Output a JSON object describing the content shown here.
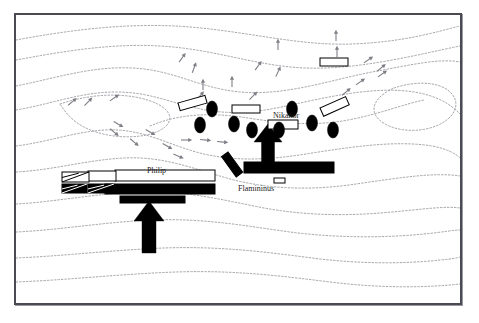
{
  "figure": {
    "kind": "battle-map",
    "title_visible": false,
    "frame": {
      "x": 14,
      "y": 13,
      "width": 448,
      "height": 292,
      "border_color": "#4a4a52",
      "background": "#ffffff"
    }
  },
  "palette": {
    "ink": "#000000",
    "contour": "#8d8d95",
    "frame": "#4a4a52",
    "paper": "#ffffff",
    "hachure": "#7e7e86"
  },
  "labels": [
    {
      "name": "label-nikanor",
      "text": "Nikanor",
      "x": 273,
      "y": 112,
      "size": 8.0
    },
    {
      "name": "label-philip",
      "text": "Philip",
      "x": 147,
      "y": 167,
      "size": 8.0
    },
    {
      "name": "label-flamininus",
      "text": "Flamininus",
      "x": 238,
      "y": 185,
      "size": 8.0
    }
  ],
  "contours": [
    "M16,40 C70,30 130,22 190,27 C250,32 300,46 352,44 C404,42 436,32 460,26",
    "M16,60 C60,52 110,43 160,46 C215,49 255,66 305,68 C360,70 420,54 460,46",
    "M16,86 C56,78 92,66 132,68 C175,70 198,88 240,92 C286,96 330,80 372,72 C410,65 440,58 460,62",
    "M16,110 C52,104 80,92 116,92 C152,92 172,104 206,110 C246,117 276,108 314,100 C352,92 392,86 424,94 C444,99 454,108 460,114",
    "M60,104 C84,96 112,92 140,98 C166,104 176,116 166,126 C154,138 120,140 96,132 C74,125 66,113 60,104",
    "M150,126 C178,114 210,112 248,118 C286,124 316,126 348,120 C380,114 404,104 424,100",
    "M394,88 C418,80 442,82 452,94 C462,106 452,122 430,128 C408,134 384,128 376,116 C370,106 378,95 394,88",
    "M16,146 C48,142 74,132 104,130 C140,128 162,142 196,152 C232,162 268,160 306,154 C350,147 396,140 432,146 C448,149 456,154 460,158",
    "M16,172 C54,170 86,160 124,158 C166,156 196,170 234,180 C274,190 316,190 356,184 C398,178 434,172 460,176",
    "M16,204 C54,202 92,194 136,192 C186,190 222,200 264,208 C308,216 350,216 392,212 C424,209 446,206 460,208",
    "M16,232 C60,230 104,222 152,220 C204,218 246,226 290,232 C336,238 384,238 424,234 C444,232 454,230 460,230",
    "M16,258 C64,256 112,250 164,248 C220,246 266,252 312,258 C358,264 404,264 440,260 C452,259 457,258 460,257",
    "M16,282 C68,280 120,274 176,272 C234,270 282,276 330,282 C378,288 424,288 460,284"
  ],
  "hachures": [
    {
      "x": 336,
      "y": 36,
      "angle": 0
    },
    {
      "x": 337,
      "y": 52,
      "angle": 0
    },
    {
      "x": 278,
      "y": 45,
      "angle": 0
    },
    {
      "x": 182,
      "y": 58,
      "angle": 35
    },
    {
      "x": 194,
      "y": 68,
      "angle": 20
    },
    {
      "x": 258,
      "y": 66,
      "angle": 35
    },
    {
      "x": 278,
      "y": 72,
      "angle": 25
    },
    {
      "x": 203,
      "y": 85,
      "angle": 0
    },
    {
      "x": 232,
      "y": 82,
      "angle": 0
    },
    {
      "x": 200,
      "y": 96,
      "angle": 40
    },
    {
      "x": 253,
      "y": 96,
      "angle": 45
    },
    {
      "x": 368,
      "y": 60,
      "angle": 55
    },
    {
      "x": 382,
      "y": 74,
      "angle": 55
    },
    {
      "x": 360,
      "y": 82,
      "angle": 55
    },
    {
      "x": 346,
      "y": 92,
      "angle": 50
    },
    {
      "x": 381,
      "y": 68,
      "angle": 50
    },
    {
      "x": 72,
      "y": 102,
      "angle": 50
    },
    {
      "x": 88,
      "y": 102,
      "angle": 45
    },
    {
      "x": 114,
      "y": 98,
      "angle": 55
    },
    {
      "x": 118,
      "y": 124,
      "angle": 120
    },
    {
      "x": 114,
      "y": 132,
      "angle": 130
    },
    {
      "x": 134,
      "y": 142,
      "angle": 130
    },
    {
      "x": 150,
      "y": 132,
      "angle": 120
    },
    {
      "x": 167,
      "y": 146,
      "angle": 120
    },
    {
      "x": 186,
      "y": 140,
      "angle": 90
    },
    {
      "x": 205,
      "y": 140,
      "angle": 95
    },
    {
      "x": 222,
      "y": 142,
      "angle": 95
    },
    {
      "x": 178,
      "y": 156,
      "angle": 115
    }
  ],
  "units": [
    {
      "name": "unit-macedonian-phalanx-right",
      "side": "macedonian",
      "shape": "rect-white",
      "x": 178,
      "y": 103,
      "w": 28,
      "h": 8,
      "rotate": -16
    },
    {
      "name": "unit-macedonian-phalanx-center",
      "side": "macedonian",
      "shape": "rect-white",
      "x": 232,
      "y": 105,
      "w": 28,
      "h": 8,
      "rotate": 0
    },
    {
      "name": "unit-macedonian-phalanx-nikanor",
      "side": "macedonian",
      "shape": "rect-white",
      "x": 268,
      "y": 120,
      "w": 30,
      "h": 9,
      "rotate": 0
    },
    {
      "name": "unit-macedonian-phalanx-far-right",
      "side": "macedonian",
      "shape": "rect-white",
      "x": 320,
      "y": 108,
      "w": 28,
      "h": 9,
      "rotate": -24
    },
    {
      "name": "unit-macedonian-reserve-top",
      "side": "macedonian",
      "shape": "rect-white",
      "x": 320,
      "y": 58,
      "w": 28,
      "h": 8,
      "rotate": 0
    },
    {
      "name": "unit-macedonian-light-diagonal",
      "side": "macedonian",
      "shape": "rect-black",
      "x": 228,
      "y": 152,
      "w": 25,
      "h": 8,
      "rotate": 54
    },
    {
      "name": "unit-macedonian-left-line",
      "side": "macedonian",
      "shape": "rect-white",
      "x": 115,
      "y": 170,
      "w": 100,
      "h": 11,
      "rotate": 0
    },
    {
      "name": "unit-macedonian-left-second",
      "side": "macedonian",
      "shape": "rect-white",
      "x": 88,
      "y": 171,
      "w": 28,
      "h": 10,
      "rotate": 0
    },
    {
      "name": "unit-macedonian-cavalry-left",
      "side": "macedonian",
      "shape": "rect-white-cav",
      "x": 62,
      "y": 172,
      "w": 27,
      "h": 10,
      "rotate": 0
    },
    {
      "name": "unit-roman-legion-right",
      "side": "roman",
      "shape": "rect-black",
      "x": 244,
      "y": 162,
      "w": 90,
      "h": 11,
      "rotate": 0
    },
    {
      "name": "unit-roman-small-marker",
      "side": "roman",
      "shape": "rect-white",
      "x": 274,
      "y": 178,
      "w": 11,
      "h": 5,
      "rotate": 0
    },
    {
      "name": "unit-roman-legion-left",
      "side": "roman",
      "shape": "rect-black",
      "x": 105,
      "y": 184,
      "w": 110,
      "h": 10,
      "rotate": 0
    },
    {
      "name": "unit-roman-left-second",
      "side": "roman",
      "shape": "rect-black",
      "x": 120,
      "y": 196,
      "w": 65,
      "h": 7,
      "rotate": 0
    },
    {
      "name": "unit-roman-cavalry-left-a",
      "side": "roman",
      "shape": "rect-black-cav",
      "x": 62,
      "y": 184,
      "w": 25,
      "h": 9,
      "rotate": 0
    },
    {
      "name": "unit-roman-cavalry-left-b",
      "side": "roman",
      "shape": "rect-black-cav",
      "x": 88,
      "y": 184,
      "w": 26,
      "h": 9,
      "rotate": 0
    }
  ],
  "elephants": [
    {
      "name": "elephant-1",
      "x": 212,
      "y": 109,
      "rx": 5.5,
      "ry": 8
    },
    {
      "name": "elephant-2",
      "x": 200,
      "y": 125,
      "rx": 5.5,
      "ry": 8
    },
    {
      "name": "elephant-3",
      "x": 234,
      "y": 124,
      "rx": 5.5,
      "ry": 8
    },
    {
      "name": "elephant-4",
      "x": 252,
      "y": 130,
      "rx": 5.5,
      "ry": 8
    },
    {
      "name": "elephant-5",
      "x": 279,
      "y": 130,
      "rx": 5.5,
      "ry": 8
    },
    {
      "name": "elephant-6",
      "x": 292,
      "y": 109,
      "rx": 5.5,
      "ry": 8
    },
    {
      "name": "elephant-7",
      "x": 312,
      "y": 123,
      "rx": 5.5,
      "ry": 8
    },
    {
      "name": "elephant-8",
      "x": 333,
      "y": 130,
      "rx": 5.5,
      "ry": 8
    }
  ],
  "attack_arrows": [
    {
      "name": "attack-arrow-roman-right",
      "x": 268,
      "y": 124,
      "length": 42,
      "shaft_w": 13,
      "head_w": 28,
      "head_h": 18,
      "direction": "up"
    },
    {
      "name": "attack-arrow-roman-left",
      "x": 149,
      "y": 201,
      "length": 52,
      "shaft_w": 14,
      "head_w": 30,
      "head_h": 20,
      "direction": "up"
    }
  ],
  "legend_semantics": {
    "rect-white": "infantry unit, Macedonian (open block)",
    "rect-black": "infantry unit, Roman (filled block)",
    "rect-white-cav": "cavalry unit, Macedonian (open block with diagonal)",
    "rect-black-cav": "cavalry unit, Roman (filled block with diagonal)",
    "ellipse-black": "war elephant",
    "arrow-black": "direction of attack",
    "dotted-line": "terrain contour",
    "hachure": "slope direction marker"
  }
}
